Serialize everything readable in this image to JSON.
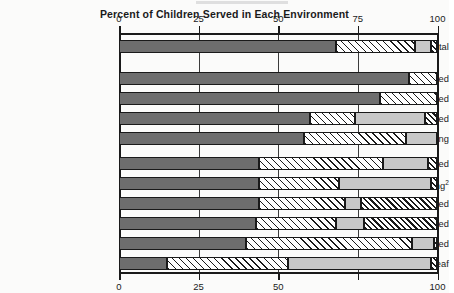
{
  "chart_data": {
    "type": "bar",
    "orientation": "horizontal",
    "stacked": true,
    "title": "Percent of Children Served in Each Environment",
    "xlabel": "",
    "ylabel": "",
    "xlim": [
      0,
      100
    ],
    "grid": true,
    "legend_position": "none",
    "axis_ticks": [
      0,
      25,
      50,
      75,
      100
    ],
    "axis_tick_labels_top": [
      "0",
      "25",
      "50",
      "75",
      "100"
    ],
    "axis_tick_labels_bottom": [
      "0",
      "25",
      "50",
      "",
      "100"
    ],
    "categories": [
      "Total",
      "Speech impaired",
      "Learning disabled",
      "Visually handicapped",
      "Hard of hearing",
      "Emotionally disturbed",
      "Deaf and hard of hearing",
      "Other health impaired",
      "Orthopedically impaired",
      "Mentally retarded",
      "Deaf"
    ],
    "category_footnotes": {
      "Deaf and hard of hearing": "2"
    },
    "series": [
      {
        "name": "Regular class",
        "fill": "dark-gray",
        "color": "#6e6e6e",
        "values": [
          68,
          91,
          82,
          60,
          58,
          44,
          44,
          44,
          43,
          40,
          15
        ]
      },
      {
        "name": "Resource room",
        "fill": "diagonal-hatch",
        "color": "#ffffff",
        "values": [
          25,
          9,
          18,
          14,
          32,
          39,
          25,
          27,
          25,
          52,
          38
        ]
      },
      {
        "name": "Separate class",
        "fill": "light-gray",
        "color": "#c8c8c8",
        "values": [
          5,
          0,
          0,
          22,
          10,
          14,
          29,
          5,
          9,
          7,
          45
        ]
      },
      {
        "name": "Separate school / other environment",
        "fill": "dense-diagonal-hatch",
        "color": "#ffffff",
        "values": [
          2,
          0,
          0,
          4,
          0,
          3,
          2,
          24,
          23,
          1,
          2
        ]
      }
    ]
  }
}
